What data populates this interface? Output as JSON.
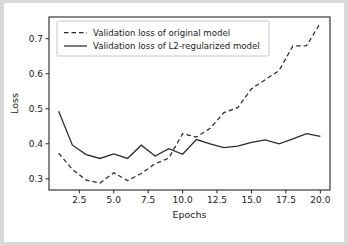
{
  "figure": {
    "background_color": "#ffffff",
    "page_background_color": "#d9d9d9",
    "line_color": "#2b2b2b"
  },
  "chart_data": {
    "type": "line",
    "title": "",
    "xlabel": "Epochs",
    "ylabel": "Loss",
    "xlim": [
      0.3,
      20.7
    ],
    "ylim": [
      0.268,
      0.762
    ],
    "xticks": [
      2.5,
      5.0,
      7.5,
      10.0,
      12.5,
      15.0,
      17.5,
      20.0
    ],
    "xticklabels": [
      "2.5",
      "5.0",
      "7.5",
      "10.0",
      "12.5",
      "15.0",
      "17.5",
      "20.0"
    ],
    "yticks": [
      0.3,
      0.4,
      0.5,
      0.6,
      0.7
    ],
    "yticklabels": [
      "0.3",
      "0.4",
      "0.5",
      "0.6",
      "0.7"
    ],
    "grid": false,
    "legend_position": "upper left",
    "x": [
      1,
      2,
      3,
      4,
      5,
      6,
      7,
      8,
      9,
      10,
      11,
      12,
      13,
      14,
      15,
      16,
      17,
      18,
      19,
      20
    ],
    "series": [
      {
        "name": "Validation loss of original model",
        "style": "dashed",
        "color": "#2b2b2b",
        "values": [
          0.373,
          0.327,
          0.296,
          0.288,
          0.317,
          0.295,
          0.315,
          0.343,
          0.359,
          0.429,
          0.419,
          0.444,
          0.489,
          0.503,
          0.557,
          0.583,
          0.609,
          0.679,
          0.68,
          0.745
        ]
      },
      {
        "name": "Validation loss of L2-regularized model",
        "style": "solid",
        "color": "#2b2b2b",
        "values": [
          0.493,
          0.396,
          0.369,
          0.358,
          0.371,
          0.358,
          0.396,
          0.365,
          0.386,
          0.37,
          0.412,
          0.4,
          0.389,
          0.393,
          0.404,
          0.411,
          0.4,
          0.414,
          0.429,
          0.421
        ]
      }
    ]
  },
  "legend": {
    "entries": [
      {
        "label": "Validation loss of original model",
        "style": "dashed"
      },
      {
        "label": "Validation loss of L2-regularized model",
        "style": "solid"
      }
    ]
  }
}
